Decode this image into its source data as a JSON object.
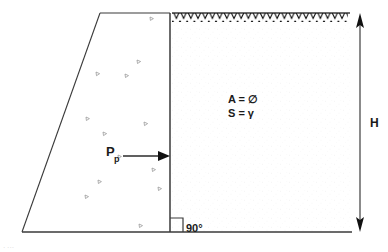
{
  "figure": {
    "type": "geotechnical-section-diagram"
  },
  "labels": {
    "force_symbol": "P",
    "force_subscript": "p",
    "angle": "90",
    "angle_degree_symbol": "°",
    "height_symbol": "H",
    "property_1_name": "A",
    "property_1_equals": "=",
    "property_1_value": "∅",
    "property_2_name": "S",
    "property_2_equals": "=",
    "property_2_value": "γ"
  },
  "annotations": {
    "force_label_full": "P p",
    "angle_label_full": "90°",
    "property_line_1": "A = ∅",
    "property_line_2": "S = γ",
    "height_label_full": "H"
  },
  "geometry": {
    "wall_face_x": 170,
    "ground_surface_y": 13,
    "base_line_y": 232,
    "wedge_top_left_x": 100,
    "wedge_bottom_left_x": 22,
    "dimension_line_x": 360,
    "hatch_start_x": 172,
    "hatch_end_x": 348,
    "arrow_tail_x": 123,
    "arrow_head_x": 170,
    "arrow_y": 156
  },
  "colors": {
    "line": "#3a3a3a",
    "hatch": "#111111",
    "text": "#1a1a1a",
    "texture_mark": "#8e8e8e",
    "backfill": "#fbfbfb",
    "background": "#ffffff"
  },
  "elements": {
    "ground_surface_hatching": "zigzag-sawtooth",
    "soil_texture": "scattered-triangle-gravel-marks",
    "right_angle_marker": "square-corner",
    "height_dimension": "double-headed-vertical-arrow",
    "force_arrow": "rightward-solid-arrow"
  }
}
